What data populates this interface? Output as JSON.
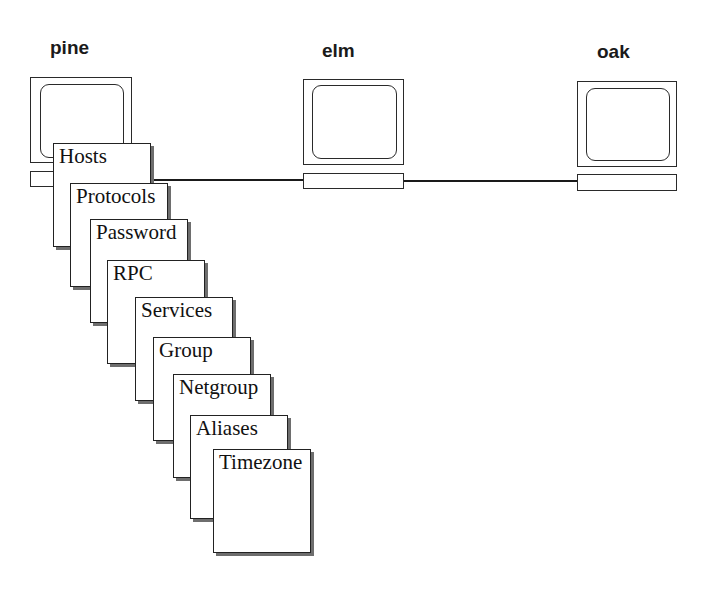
{
  "hosts": [
    {
      "name": "pine",
      "label_pos": [
        50,
        38
      ],
      "monitor": [
        30,
        77,
        102,
        86
      ],
      "screen": [
        9,
        6,
        84,
        74
      ],
      "keyboard": [
        30,
        171,
        102,
        16
      ]
    },
    {
      "name": "elm",
      "label_pos": [
        322,
        41
      ],
      "monitor": [
        303,
        79,
        101,
        86
      ],
      "screen": [
        8,
        5,
        85,
        74
      ],
      "keyboard": [
        303,
        173,
        101,
        16
      ]
    },
    {
      "name": "oak",
      "label_pos": [
        597,
        42
      ],
      "monitor": [
        577,
        81,
        100,
        86
      ],
      "screen": [
        8,
        6,
        84,
        73
      ],
      "keyboard": [
        577,
        174,
        100,
        17
      ]
    }
  ],
  "network_lines": [
    {
      "from": "pine",
      "to": "elm",
      "x1": 132,
      "x2": 303,
      "y": 179
    },
    {
      "from": "elm",
      "to": "oak",
      "x1": 404,
      "x2": 577,
      "y": 180
    }
  ],
  "nis_maps": {
    "owner": "pine",
    "cards": [
      {
        "label": "Hosts",
        "x": 53,
        "y": 143
      },
      {
        "label": "Protocols",
        "x": 70,
        "y": 183
      },
      {
        "label": "Password",
        "x": 90,
        "y": 219
      },
      {
        "label": "RPC",
        "x": 107,
        "y": 260
      },
      {
        "label": "Services",
        "x": 135,
        "y": 297
      },
      {
        "label": "Group",
        "x": 153,
        "y": 337
      },
      {
        "label": "Netgroup",
        "x": 173,
        "y": 374
      },
      {
        "label": "Aliases",
        "x": 190,
        "y": 415
      },
      {
        "label": "Timezone",
        "x": 213,
        "y": 449
      }
    ]
  },
  "colors": {
    "line": "#1a1a1a",
    "shadow": "#6e6e6e",
    "background": "#ffffff"
  }
}
